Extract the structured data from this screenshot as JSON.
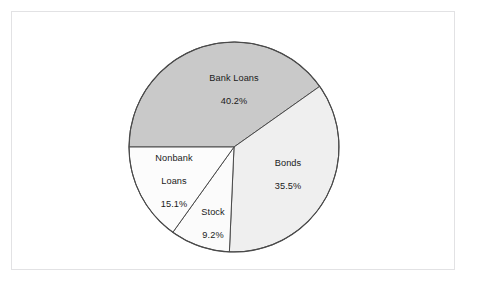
{
  "figure": {
    "background_color": "#ffffff",
    "frame_color": "#e2e2e4"
  },
  "chart_data": {
    "type": "pie",
    "title": "",
    "subtitle": "",
    "xlabel": "",
    "ylabel": "",
    "legend": "none",
    "grid": false,
    "labels_position": "inside-slices",
    "start_angle_deg": 180,
    "direction": "clockwise",
    "categories": [
      "Bank Loans",
      "Bonds",
      "Stock",
      "Nonbank Loans"
    ],
    "values": [
      40.2,
      35.5,
      9.2,
      15.1
    ],
    "value_suffix": "%",
    "slices": [
      {
        "name": "Bank Loans",
        "value": 40.2,
        "value_label": "40.2%",
        "color": "#c9c9c9",
        "edge_color": "#4a4a4a",
        "label_lines": [
          "Bank Loans",
          "40.2%"
        ]
      },
      {
        "name": "Bonds",
        "value": 35.5,
        "value_label": "35.5%",
        "color": "#efefef",
        "edge_color": "#4a4a4a",
        "label_lines": [
          "Bonds",
          "35.5%"
        ]
      },
      {
        "name": "Stock",
        "value": 9.2,
        "value_label": "9.2%",
        "color": "#fbfbfb",
        "edge_color": "#4a4a4a",
        "label_lines": [
          "Stock",
          "9.2%"
        ]
      },
      {
        "name": "Nonbank Loans",
        "value": 15.1,
        "value_label": "15.1%",
        "color": "#fcfcfc",
        "edge_color": "#4a4a4a",
        "label_lines": [
          "Nonbank",
          "Loans",
          "15.1%"
        ]
      }
    ]
  },
  "labels": {
    "bank_loans": "Bank Loans\n40.2%",
    "bonds": "Bonds\n35.5%",
    "stock": "Stock\n9.2%",
    "nonbank_loans": "Nonbank\nLoans\n15.1%"
  }
}
